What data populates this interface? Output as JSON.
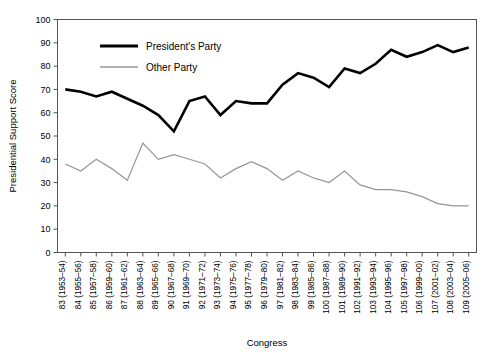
{
  "chart_data": {
    "type": "line",
    "title": "",
    "xlabel": "Congress",
    "ylabel": "Presidential Support Score",
    "ylim": [
      0,
      100
    ],
    "yticks": [
      0,
      10,
      20,
      30,
      40,
      50,
      60,
      70,
      80,
      90,
      100
    ],
    "grid": false,
    "legend_position": "top-center-inside",
    "categories": [
      "83 (1953–54)",
      "84 (1955–56)",
      "85 (1957–58)",
      "86 (1959–60)",
      "87 (1961–62)",
      "88 (1963–64)",
      "89 (1965–66)",
      "90 (1967–68)",
      "91 (1969–70)",
      "92 (1971–72)",
      "93 (1973–74)",
      "94 (1975–76)",
      "95 (1977–78)",
      "96 (1979–80)",
      "97 (1981–82)",
      "98 (1983–84)",
      "99 (1985–86)",
      "100 (1987–88)",
      "101 (1989–90)",
      "102 (1991–92)",
      "103 (1993–94)",
      "104 (1995–96)",
      "105 (1997–98)",
      "106 (1999–00)",
      "107 (2001–02)",
      "108 (2003–04)",
      "109 (2005–06)"
    ],
    "series": [
      {
        "name": "President's Party",
        "color": "#000000",
        "width": 2.6,
        "values": [
          70,
          69,
          67,
          69,
          66,
          63,
          59,
          52,
          65,
          67,
          59,
          65,
          64,
          64,
          72,
          77,
          75,
          71,
          79,
          77,
          81,
          87,
          84,
          86,
          89,
          86,
          88
        ]
      },
      {
        "name": "Other Party",
        "color": "#969696",
        "width": 1.2,
        "values": [
          38,
          35,
          40,
          36,
          31,
          47,
          40,
          42,
          40,
          38,
          32,
          36,
          39,
          36,
          31,
          35,
          32,
          30,
          35,
          29,
          27,
          27,
          26,
          24,
          21,
          20,
          20
        ]
      }
    ]
  },
  "legend": {
    "items": [
      {
        "label": "President's  Party",
        "color": "#000000"
      },
      {
        "label": "Other Party",
        "color": "#969696"
      }
    ]
  },
  "axes": {
    "ylabel": "Presidential Support Score",
    "xlabel": "Congress"
  }
}
